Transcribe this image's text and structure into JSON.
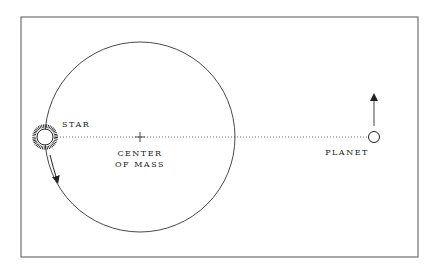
{
  "diagram": {
    "labels": {
      "star": "STAR",
      "center_line1": "CENTER",
      "center_line2": "OF MASS",
      "planet": "PLANET"
    },
    "colors": {
      "line": "#333333",
      "frame": "#555555",
      "background": "#ffffff"
    }
  }
}
